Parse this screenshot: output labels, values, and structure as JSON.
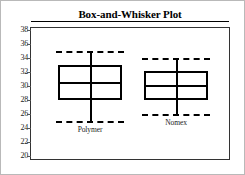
{
  "chart_data": {
    "type": "box",
    "title": "Box-and-Whisker Plot",
    "xlabel": "",
    "ylabel": "",
    "ylim": [
      20,
      38
    ],
    "grid": false,
    "legend": "none",
    "y_ticks": [
      38,
      36,
      34,
      32,
      30,
      28,
      26,
      24,
      22,
      20
    ],
    "categories": [
      "Polymer",
      "Nomex"
    ],
    "boxes": [
      {
        "name": "Polymer",
        "whisker_low": 25,
        "q1": 28,
        "median": 30.6,
        "q3": 33,
        "whisker_high": 35
      },
      {
        "name": "Nomex",
        "whisker_low": 26,
        "q1": 28,
        "median": 30.1,
        "q3": 32.2,
        "whisker_high": 34
      }
    ]
  },
  "style": {
    "line_color": "#000000",
    "frame_color": "#333333",
    "outer_border_color": "#b9b9b9",
    "background": "#ffffff"
  }
}
